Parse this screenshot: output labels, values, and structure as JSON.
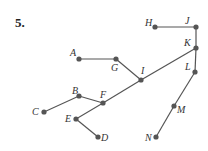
{
  "problem": {
    "number": "5."
  },
  "nodes": [
    {
      "id": "A",
      "label": "A",
      "x": 79,
      "y": 59,
      "lx": 70,
      "ly": 56
    },
    {
      "id": "G",
      "label": "G",
      "x": 116,
      "y": 59,
      "lx": 111,
      "ly": 71
    },
    {
      "id": "I",
      "label": "I",
      "x": 141,
      "y": 80,
      "lx": 141,
      "ly": 74
    },
    {
      "id": "H",
      "label": "H",
      "x": 155,
      "y": 27,
      "lx": 145,
      "ly": 26
    },
    {
      "id": "J",
      "label": "J",
      "x": 196,
      "y": 27,
      "lx": 185,
      "ly": 24
    },
    {
      "id": "K",
      "label": "K",
      "x": 196,
      "y": 48,
      "lx": 184,
      "ly": 46
    },
    {
      "id": "L",
      "label": "L",
      "x": 195,
      "y": 72,
      "lx": 185,
      "ly": 70
    },
    {
      "id": "M",
      "label": "M",
      "x": 174,
      "y": 106,
      "lx": 177,
      "ly": 113
    },
    {
      "id": "N",
      "label": "N",
      "x": 156,
      "y": 137,
      "lx": 145,
      "ly": 141
    },
    {
      "id": "B",
      "label": "B",
      "x": 79,
      "y": 96,
      "lx": 72,
      "ly": 94
    },
    {
      "id": "F",
      "label": "F",
      "x": 103,
      "y": 103,
      "lx": 100,
      "ly": 98
    },
    {
      "id": "C",
      "label": "C",
      "x": 44,
      "y": 112,
      "lx": 32,
      "ly": 115
    },
    {
      "id": "E",
      "label": "E",
      "x": 76,
      "y": 119,
      "lx": 65,
      "ly": 122
    },
    {
      "id": "D",
      "label": "D",
      "x": 98,
      "y": 137,
      "lx": 101,
      "ly": 141
    }
  ],
  "edges": [
    [
      "A",
      "G"
    ],
    [
      "G",
      "I"
    ],
    [
      "H",
      "J"
    ],
    [
      "J",
      "K"
    ],
    [
      "K",
      "L"
    ],
    [
      "L",
      "M"
    ],
    [
      "M",
      "N"
    ],
    [
      "K",
      "I"
    ],
    [
      "I",
      "F"
    ],
    [
      "F",
      "B"
    ],
    [
      "B",
      "C"
    ],
    [
      "F",
      "E"
    ],
    [
      "E",
      "D"
    ]
  ]
}
